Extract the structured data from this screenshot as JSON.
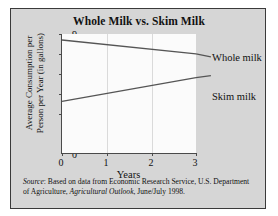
{
  "figure": {
    "title": "Whole Milk vs. Skim Milk",
    "source_prefix": "Source",
    "source_text": ": Based on data from Economic Research Service, U.S. Department of Agriculture, ",
    "source_italic_work": "Agricultural Outlook",
    "source_suffix": ", June/July 1998.",
    "background_color": "#d6d6d6",
    "plot_background_color": "#fbfbfb",
    "line_color": "#555555",
    "grid_color": "#dadada"
  },
  "chart_data": {
    "type": "line",
    "title": "Whole Milk vs. Skim Milk",
    "xlabel": "Years",
    "ylabel_line1": "Average Consumption per",
    "ylabel_line2": "Person per Year (in gallons)",
    "x": [
      0,
      3
    ],
    "xticks": [
      "0",
      "1",
      "2",
      "3"
    ],
    "xtick_values": [
      0,
      1,
      2,
      3
    ],
    "yticks": [
      "0",
      "5",
      "6",
      "7",
      "8",
      "9"
    ],
    "ytick_values": [
      0,
      5,
      6,
      7,
      8,
      9
    ],
    "xlim": [
      0,
      3
    ],
    "ylim": [
      5,
      9
    ],
    "y_axis_break": true,
    "grid": "vertical",
    "legend_position": "right-inline",
    "series": [
      {
        "name": "Whole milk",
        "label": "Whole milk",
        "values": [
          8.7,
          8.0
        ]
      },
      {
        "name": "Skim milk",
        "label": "Skim milk",
        "values": [
          5.6,
          6.8
        ]
      }
    ]
  }
}
